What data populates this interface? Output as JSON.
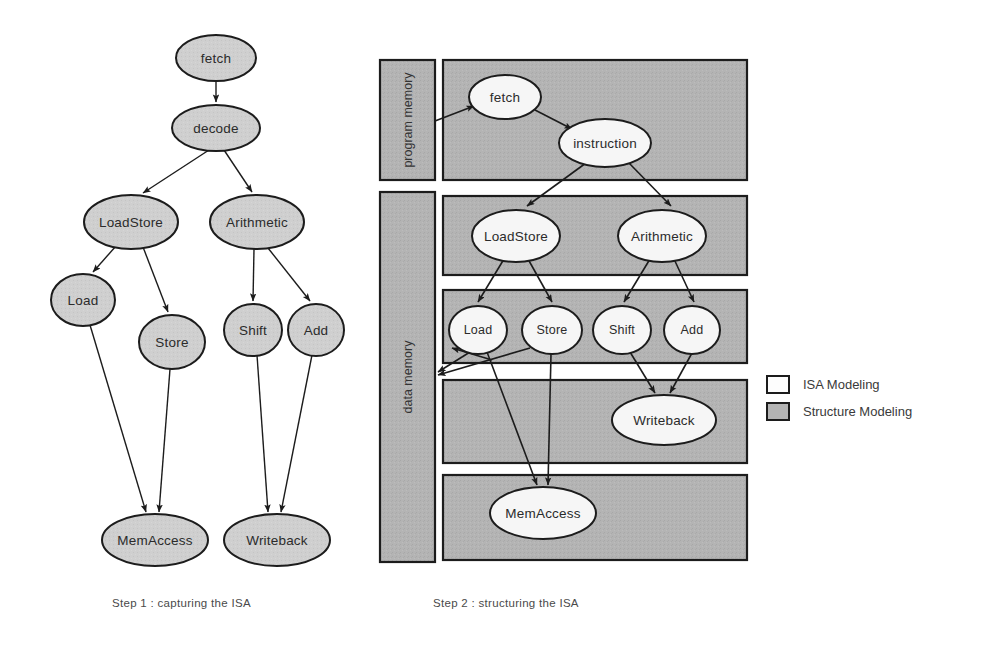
{
  "figure": {
    "colors": {
      "node_fill_step1": "#cfcfcf",
      "node_fill_step2": "#f5f5f5",
      "structure_fill": "#b4b4b4",
      "outline": "#1c1c1c",
      "text": "#2b2b2b"
    }
  },
  "step1": {
    "caption": "Step 1 : capturing the ISA",
    "nodes": [
      {
        "id": "fetch",
        "label": "fetch",
        "cx": 216,
        "cy": 58,
        "rx": 40,
        "ry": 23
      },
      {
        "id": "decode",
        "label": "decode",
        "cx": 216,
        "cy": 128,
        "rx": 44,
        "ry": 23
      },
      {
        "id": "loadstore",
        "label": "LoadStore",
        "cx": 131,
        "cy": 222,
        "rx": 47,
        "ry": 27
      },
      {
        "id": "arithmetic",
        "label": "Arithmetic",
        "cx": 257,
        "cy": 222,
        "rx": 47,
        "ry": 27
      },
      {
        "id": "load",
        "label": "Load",
        "cx": 83,
        "cy": 300,
        "rx": 32,
        "ry": 26
      },
      {
        "id": "store",
        "label": "Store",
        "cx": 172,
        "cy": 342,
        "rx": 33,
        "ry": 27
      },
      {
        "id": "shift",
        "label": "Shift",
        "cx": 253,
        "cy": 330,
        "rx": 29,
        "ry": 26
      },
      {
        "id": "add",
        "label": "Add",
        "cx": 316,
        "cy": 330,
        "rx": 28,
        "ry": 26
      },
      {
        "id": "memaccess",
        "label": "MemAccess",
        "cx": 155,
        "cy": 540,
        "rx": 53,
        "ry": 26
      },
      {
        "id": "writeback",
        "label": "Writeback",
        "cx": 277,
        "cy": 540,
        "rx": 53,
        "ry": 26
      }
    ],
    "edges": [
      {
        "from": "fetch",
        "to": "decode"
      },
      {
        "from": "decode",
        "to": "loadstore"
      },
      {
        "from": "decode",
        "to": "arithmetic"
      },
      {
        "from": "loadstore",
        "to": "load"
      },
      {
        "from": "loadstore",
        "to": "store"
      },
      {
        "from": "arithmetic",
        "to": "shift"
      },
      {
        "from": "arithmetic",
        "to": "add"
      },
      {
        "from": "load",
        "to": "memaccess"
      },
      {
        "from": "store",
        "to": "memaccess"
      },
      {
        "from": "shift",
        "to": "writeback"
      },
      {
        "from": "add",
        "to": "writeback"
      }
    ]
  },
  "step2": {
    "caption": "Step 2 : structuring the ISA",
    "memory_blocks": [
      {
        "id": "program-memory",
        "label": "program memory",
        "x": 380,
        "y": 60,
        "w": 55,
        "h": 120
      },
      {
        "id": "data-memory",
        "label": "data memory",
        "x": 380,
        "y": 192,
        "w": 55,
        "h": 370
      }
    ],
    "stage_rows": [
      {
        "id": "row-fetch",
        "x": 443,
        "y": 60,
        "w": 304,
        "h": 120
      },
      {
        "id": "row-decode",
        "x": 443,
        "y": 196,
        "w": 304,
        "h": 79
      },
      {
        "id": "row-execute",
        "x": 443,
        "y": 290,
        "w": 304,
        "h": 73
      },
      {
        "id": "row-writeback",
        "x": 443,
        "y": 380,
        "w": 304,
        "h": 83
      },
      {
        "id": "row-memaccess",
        "x": 443,
        "y": 475,
        "w": 304,
        "h": 85
      }
    ],
    "nodes": [
      {
        "id": "fetch",
        "label": "fetch",
        "cx": 505,
        "cy": 97,
        "rx": 36,
        "ry": 22
      },
      {
        "id": "instruction",
        "label": "instruction",
        "cx": 605,
        "cy": 143,
        "rx": 46,
        "ry": 24
      },
      {
        "id": "loadstore",
        "label": "LoadStore",
        "cx": 516,
        "cy": 236,
        "rx": 44,
        "ry": 26
      },
      {
        "id": "arithmetic",
        "label": "Arithmetic",
        "cx": 662,
        "cy": 236,
        "rx": 44,
        "ry": 26
      },
      {
        "id": "load",
        "label": "Load",
        "cx": 478,
        "cy": 330,
        "rx": 29,
        "ry": 24
      },
      {
        "id": "store",
        "label": "Store",
        "cx": 552,
        "cy": 330,
        "rx": 30,
        "ry": 24
      },
      {
        "id": "shift",
        "label": "Shift",
        "cx": 622,
        "cy": 330,
        "rx": 29,
        "ry": 24
      },
      {
        "id": "add",
        "label": "Add",
        "cx": 692,
        "cy": 330,
        "rx": 28,
        "ry": 24
      },
      {
        "id": "writeback",
        "label": "Writeback",
        "cx": 664,
        "cy": 420,
        "rx": 52,
        "ry": 25
      },
      {
        "id": "memaccess",
        "label": "MemAccess",
        "cx": 543,
        "cy": 513,
        "rx": 53,
        "ry": 26
      }
    ],
    "edges": [
      {
        "from": "program-memory",
        "to": "fetch"
      },
      {
        "from": "fetch",
        "to": "instruction"
      },
      {
        "from": "instruction",
        "to": "loadstore"
      },
      {
        "from": "instruction",
        "to": "arithmetic"
      },
      {
        "from": "loadstore",
        "to": "load"
      },
      {
        "from": "loadstore",
        "to": "store"
      },
      {
        "from": "arithmetic",
        "to": "shift"
      },
      {
        "from": "arithmetic",
        "to": "add"
      },
      {
        "from": "load",
        "to": "memaccess"
      },
      {
        "from": "store",
        "to": "memaccess"
      },
      {
        "from": "shift",
        "to": "writeback"
      },
      {
        "from": "add",
        "to": "writeback"
      },
      {
        "from": "store",
        "to": "data-memory"
      },
      {
        "from": "memaccess",
        "to": "data-memory"
      }
    ]
  },
  "legend": {
    "items": [
      {
        "id": "isa-modeling",
        "label": "ISA Modeling",
        "swatch": "#fdfdfd"
      },
      {
        "id": "structure-modeling",
        "label": "Structure Modeling",
        "swatch": "#b4b4b4"
      }
    ]
  }
}
